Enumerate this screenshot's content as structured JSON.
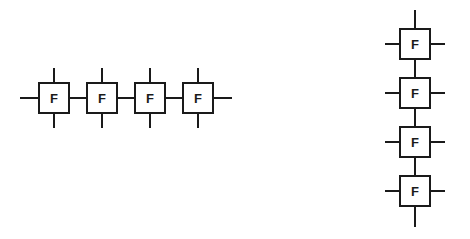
{
  "diagram": {
    "background_color": "#ffffff",
    "line_color": "#1a1a1a",
    "canvas": {
      "width": 470,
      "height": 239
    },
    "block_label": "F",
    "block_size": 32,
    "line_width": 2,
    "stub_length": 14,
    "link_length": 16,
    "groups": [
      {
        "name": "horizontal-chain",
        "orientation": "horizontal",
        "count": 4,
        "blocks": [
          {
            "label": "F",
            "x": 38,
            "y": 82
          },
          {
            "label": "F",
            "x": 86,
            "y": 82
          },
          {
            "label": "F",
            "x": 134,
            "y": 82
          },
          {
            "label": "F",
            "x": 182,
            "y": 82
          }
        ]
      },
      {
        "name": "vertical-chain",
        "orientation": "vertical",
        "count": 4,
        "blocks": [
          {
            "label": "F",
            "x": 399,
            "y": 28
          },
          {
            "label": "F",
            "x": 399,
            "y": 77
          },
          {
            "label": "F",
            "x": 399,
            "y": 126
          },
          {
            "label": "F",
            "x": 399,
            "y": 175
          }
        ]
      }
    ]
  }
}
